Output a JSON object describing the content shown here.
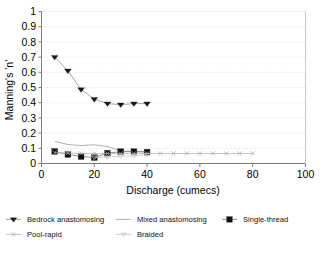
{
  "chart_data": {
    "type": "line",
    "title": "",
    "xlabel": "Discharge (cumecs)",
    "ylabel": "Manning's 'n'",
    "xlim": [
      0,
      100
    ],
    "ylim": [
      0,
      1
    ],
    "xticks": [
      "0",
      "20",
      "40",
      "60",
      "80",
      "100"
    ],
    "xtick_values": [
      0,
      20,
      40,
      60,
      80,
      100
    ],
    "yticks": [
      "0",
      "0.1",
      "0.2",
      "0.3",
      "0.4",
      "0.5",
      "0.6",
      "0.7",
      "0.8",
      "0.9",
      "1"
    ],
    "ytick_values": [
      0,
      0.1,
      0.2,
      0.3,
      0.4,
      0.5,
      0.6,
      0.7,
      0.8,
      0.9,
      1
    ],
    "grid": true,
    "grid_axis": "y",
    "legend_position": "bottom",
    "series": [
      {
        "name": "Bedrock anastomosing",
        "marker": "triangle-down-filled",
        "marker_color": "#1a1a1a",
        "line_color": "#8c8c8c",
        "x": [
          5,
          10,
          15,
          20,
          25,
          30,
          35,
          40
        ],
        "values": [
          0.7,
          0.61,
          0.487,
          0.423,
          0.394,
          0.387,
          0.394,
          0.394
        ]
      },
      {
        "name": "Mixed anastomosing",
        "marker": "none",
        "marker_color": "#9a9a9a",
        "line_color": "#9a9a9a",
        "x": [
          5,
          10,
          15,
          20,
          25,
          30,
          35,
          40
        ],
        "values": [
          0.145,
          0.125,
          0.118,
          0.123,
          0.112,
          0.083,
          0.08,
          0.08
        ]
      },
      {
        "name": "Single-thread",
        "marker": "square-filled",
        "marker_color": "#111111",
        "line_color": "#777777",
        "x": [
          5,
          10,
          15,
          20,
          25,
          30,
          35,
          40
        ],
        "values": [
          0.079,
          0.059,
          0.046,
          0.039,
          0.068,
          0.078,
          0.078,
          0.075
        ]
      },
      {
        "name": "Pool-rapid",
        "marker": "x-thin",
        "marker_color": "#a8a8a8",
        "line_color": "#b4b4b4",
        "x": [
          5,
          10,
          15,
          20,
          25,
          30,
          35,
          40,
          45,
          50,
          55,
          60,
          65,
          70,
          75,
          80
        ],
        "values": [
          0.072,
          0.068,
          0.066,
          0.066,
          0.066,
          0.066,
          0.066,
          0.066,
          0.066,
          0.066,
          0.066,
          0.066,
          0.066,
          0.066,
          0.066,
          0.066
        ]
      },
      {
        "name": "Braided",
        "marker": "triangle-down-open",
        "marker_color": "#c0c0c0",
        "line_color": "#c8c8c8",
        "x": [
          20,
          25,
          30,
          35,
          40
        ],
        "values": [
          0.04,
          0.041,
          0.048,
          0.05,
          0.058
        ]
      }
    ]
  },
  "legend": {
    "entries": [
      {
        "label": "Bedrock anastomosing",
        "marker": "triangle-down-filled"
      },
      {
        "label": "Mixed anastomosing",
        "marker": "none"
      },
      {
        "label": "Single-thread",
        "marker": "square-filled"
      },
      {
        "label": "Pool-rapid",
        "marker": "x-thin"
      },
      {
        "label": "Braided",
        "marker": "triangle-down-open"
      }
    ]
  },
  "colors": {
    "axis": "#6f6f6f",
    "grid": "#d6d6d6",
    "text": "#000000",
    "plot_background": "#ffffff"
  }
}
